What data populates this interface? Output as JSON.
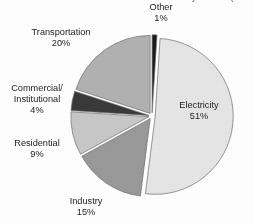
{
  "figure": {
    "title": "Greenhouse Gas Emissions by Sector (Carbon Dioxide)",
    "title_visible": false,
    "title_note": "cropped off top edge of screenshot"
  },
  "chart_data": {
    "type": "pie",
    "title": "Greenhouse Gas Emissions by Sector (Carbon Dioxide)",
    "xlabel": "",
    "ylabel": "",
    "legend_position": "none",
    "labels_position": "outside-callout",
    "exploded": true,
    "start_angle_deg": 0,
    "direction": "clockwise",
    "categories": [
      "Other",
      "Electricity",
      "Industry",
      "Residential",
      "Commercial/Institutional",
      "Transportation"
    ],
    "values": [
      1,
      51,
      15,
      9,
      4,
      20
    ],
    "units": "percent",
    "total": 100,
    "colors": [
      "#1a1a1a",
      "#e6e6e6",
      "#9a9a9a",
      "#c8c8c8",
      "#3a3a3a",
      "#b2b2b2"
    ],
    "slices": [
      {
        "label": "Other",
        "value": 1,
        "display_value": "1%",
        "color": "#1a1a1a"
      },
      {
        "label": "Electricity",
        "value": 51,
        "display_value": "51%",
        "color": "#e6e6e6"
      },
      {
        "label": "Industry",
        "value": 15,
        "display_value": "15%",
        "color": "#9a9a9a"
      },
      {
        "label": "Residential",
        "value": 9,
        "display_value": "9%",
        "color": "#c8c8c8"
      },
      {
        "label": "Commercial/\nInstitutional",
        "value": 4,
        "display_value": "4%",
        "color": "#3a3a3a"
      },
      {
        "label": "Transportation",
        "value": 20,
        "display_value": "20%",
        "color": "#b2b2b2"
      }
    ]
  },
  "labels": {
    "other": {
      "name": "Other",
      "pct": "1%"
    },
    "electricity": {
      "name": "Electricity",
      "pct": "51%"
    },
    "industry": {
      "name": "Industry",
      "pct": "15%"
    },
    "residential": {
      "name": "Residential",
      "pct": "9%"
    },
    "commercial": {
      "line1": "Commercial/",
      "line2": "Institutional",
      "pct": "4%"
    },
    "transportation": {
      "name": "Transportation",
      "pct": "20%"
    }
  }
}
